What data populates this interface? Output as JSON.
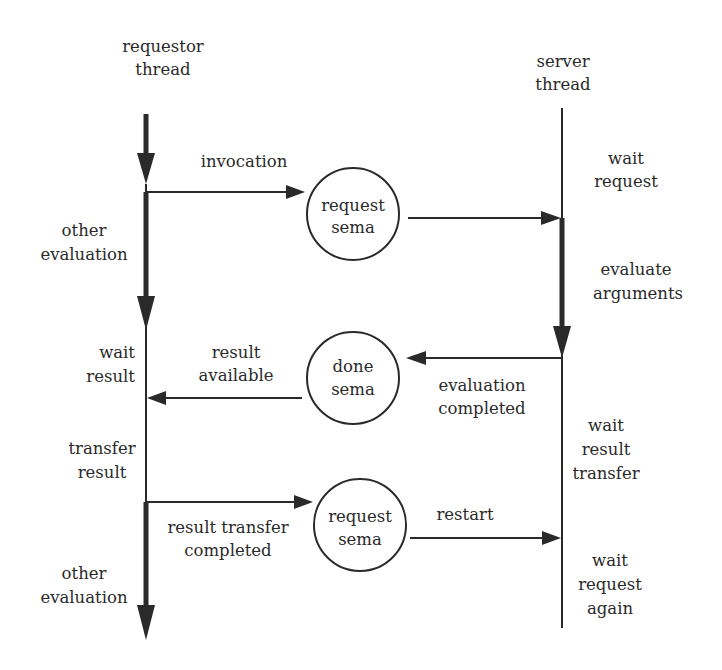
{
  "diagram": {
    "type": "sequence-flow",
    "colors": {
      "ink": "#2a2a2a",
      "background": "#ffffff"
    },
    "threads": {
      "requestor": {
        "title_line1": "requestor",
        "title_line2": "thread"
      },
      "server": {
        "title_line1": "server",
        "title_line2": "thread"
      }
    },
    "requestor_states": [
      {
        "line1": "other",
        "line2": "evaluation"
      },
      {
        "line1": "wait",
        "line2": "result"
      },
      {
        "line1": "transfer",
        "line2": "result"
      },
      {
        "line1": "other",
        "line2": "evaluation"
      }
    ],
    "server_states": [
      {
        "line1": "wait",
        "line2": "request"
      },
      {
        "line1": "evaluate",
        "line2": "arguments"
      },
      {
        "line1": "wait",
        "line2": "result",
        "line3": "transfer"
      },
      {
        "line1": "wait",
        "line2": "request",
        "line3": "again"
      }
    ],
    "semaphores": [
      {
        "line1": "request",
        "line2": "sema"
      },
      {
        "line1": "done",
        "line2": "sema"
      },
      {
        "line1": "request",
        "line2": "sema"
      }
    ],
    "messages": {
      "invocation": "invocation",
      "result_available_1": "result",
      "result_available_2": "available",
      "evaluation_completed_1": "evaluation",
      "evaluation_completed_2": "completed",
      "result_transfer_completed_1": "result transfer",
      "result_transfer_completed_2": "completed",
      "restart": "restart"
    }
  }
}
